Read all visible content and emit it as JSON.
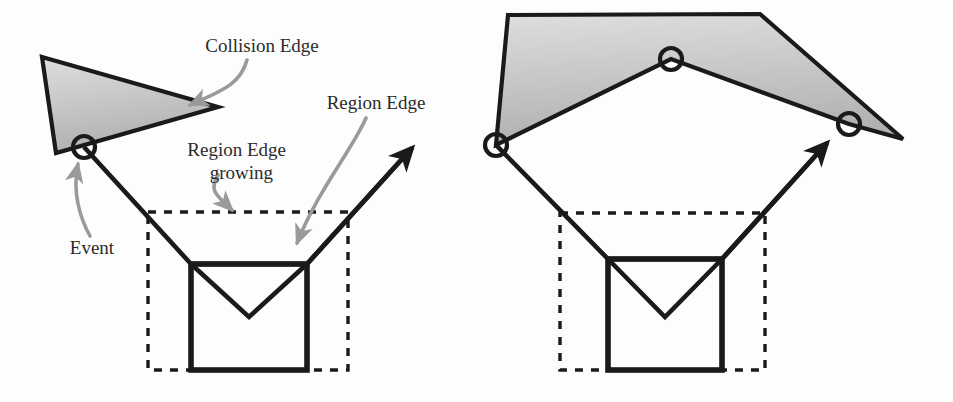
{
  "figure": {
    "background_color": "#fdfdfd",
    "width": 953,
    "height": 402,
    "stroke_color": "#1a1a1a",
    "shape_fill_top": "#dedede",
    "shape_fill_bottom": "#b0b0b0",
    "annotation_arrow_color": "#9a9a9a",
    "label_color": "#2b2b2b"
  },
  "labels": {
    "collision_edge": "Collision Edge",
    "region_edge": "Region Edge",
    "region_edge_growing_line1": "Region Edge",
    "region_edge_growing_line2": "growing",
    "event": "Event"
  },
  "panels": [
    {
      "name": "before-collision",
      "shape": {
        "type": "triangle",
        "points": "42,57 218,107 56,153"
      },
      "event_markers": [
        {
          "cx": 84,
          "cy": 147,
          "r": 11
        }
      ],
      "region_boundary_polyline": "84,147 191,264 307,264 412,148",
      "wavefront_v": "191,264 249,317 307,264",
      "solid_box": {
        "x": 191,
        "y": 264,
        "width": 116,
        "height": 106
      },
      "dashed_box": {
        "x": 148,
        "y": 212,
        "width": 200,
        "height": 158
      },
      "growth_arrow": {
        "x1": 307,
        "y1": 264,
        "x2": 412,
        "y2": 148
      }
    },
    {
      "name": "after-collision",
      "shape": {
        "type": "polygon",
        "points": "508,15 760,14 903,139 849,124 671,59 496,145"
      },
      "event_markers": [
        {
          "cx": 496,
          "cy": 145,
          "r": 11
        },
        {
          "cx": 671,
          "cy": 59,
          "r": 11
        },
        {
          "cx": 849,
          "cy": 124,
          "r": 11
        }
      ],
      "region_boundary_polyline": "496,145 608,259 722,259 827,143",
      "wavefront_v": "608,259 665,317 722,259",
      "solid_box": {
        "x": 608,
        "y": 259,
        "width": 114,
        "height": 111
      },
      "dashed_box": {
        "x": 560,
        "y": 213,
        "width": 205,
        "height": 157
      },
      "growth_arrow": {
        "x1": 722,
        "y1": 259,
        "x2": 827,
        "y2": 143
      }
    }
  ],
  "annotations": [
    {
      "name": "collision-edge",
      "text_key": "collision_edge",
      "text_x": 262,
      "text_y": 48,
      "leader_path": "M 247,60 C 240,86 218,92 190,105",
      "arrow_tip": "190,105"
    },
    {
      "name": "region-edge",
      "text_key": "region_edge",
      "text_x": 376,
      "text_y": 105,
      "leader_path": "M 366,118 C 352,150 318,190 297,243",
      "arrow_tip": "297,243"
    },
    {
      "name": "region-edge-growing",
      "text_key": "region_edge_growing",
      "text_x": 258,
      "text_y": 152,
      "leader_path": "M 218,175 C 208,192 218,196 232,210",
      "arrow_tip": "232,210"
    },
    {
      "name": "event",
      "text_key": "event",
      "text_x": 92,
      "text_y": 250,
      "leader_path": "M 90,236 C 80,218 72,192 78,164",
      "arrow_tip": "78,164"
    }
  ]
}
